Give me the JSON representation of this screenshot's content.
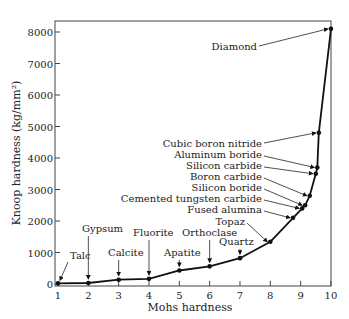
{
  "chart_data": {
    "type": "line",
    "title": "",
    "xlabel": "Mohs hardness",
    "ylabel": "Knoop hardness (kg/mm²)",
    "xlim": [
      1,
      10
    ],
    "ylim": [
      0,
      8300
    ],
    "x_ticks": [
      1,
      2,
      3,
      4,
      5,
      6,
      7,
      8,
      9,
      10
    ],
    "y_ticks": [
      0,
      1000,
      2000,
      3000,
      4000,
      5000,
      6000,
      7000,
      8000
    ],
    "grid": false,
    "legend": null,
    "series": [
      {
        "name": "Mineral hardness",
        "points": [
          {
            "label": "Talc",
            "x": 1,
            "y": 20
          },
          {
            "label": "Gypsum",
            "x": 2,
            "y": 32
          },
          {
            "label": "Calcite",
            "x": 3,
            "y": 135
          },
          {
            "label": "Fluorite",
            "x": 4,
            "y": 163
          },
          {
            "label": "Apatite",
            "x": 5,
            "y": 430
          },
          {
            "label": "Orthoclase",
            "x": 6,
            "y": 560
          },
          {
            "label": "Quartz",
            "x": 7,
            "y": 820
          },
          {
            "label": "Topaz",
            "x": 8,
            "y": 1340
          },
          {
            "label": "Fused alumina",
            "x": 8.75,
            "y": 2100
          },
          {
            "label": "Cemented tungsten carbide",
            "x": 9.05,
            "y": 2400
          },
          {
            "label": "Silicon boride",
            "x": 9.15,
            "y": 2500
          },
          {
            "label": "Boron carbide",
            "x": 9.3,
            "y": 2800
          },
          {
            "label": "Silicon carbide",
            "x": 9.5,
            "y": 3500
          },
          {
            "label": "Aluminum boride",
            "x": 9.55,
            "y": 3700
          },
          {
            "label": "Cubic boron nitride",
            "x": 9.6,
            "y": 4800
          },
          {
            "label": "Diamond",
            "x": 10,
            "y": 8100
          }
        ]
      }
    ],
    "annotations": [
      "Talc",
      "Gypsum",
      "Calcite",
      "Fluorite",
      "Apatite",
      "Orthoclase",
      "Quartz",
      "Topaz",
      "Fused alumina",
      "Cemented tungsten carbide",
      "Silicon boride",
      "Boron carbide",
      "Silicon carbide",
      "Aluminum boride",
      "Cubic boron nitride",
      "Diamond"
    ]
  }
}
